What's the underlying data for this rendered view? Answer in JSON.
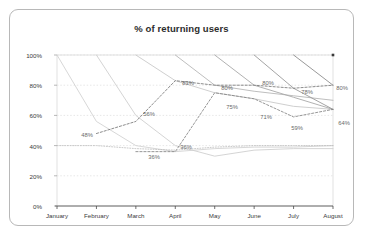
{
  "card": {
    "border_color": "#b8b8b8"
  },
  "chart_data": {
    "type": "line",
    "title": "% of returning users",
    "xlabel": "",
    "ylabel": "",
    "categories": [
      "January",
      "February",
      "March",
      "April",
      "May",
      "June",
      "July",
      "August"
    ],
    "ylim": [
      0,
      100
    ],
    "yticks": [
      "0%",
      "20%",
      "40%",
      "60%",
      "80%",
      "100%"
    ],
    "ytick_values": [
      0,
      20,
      40,
      60,
      80,
      100
    ],
    "grid": true,
    "grid_color": "#dcdcdc",
    "legend": "none",
    "series": [
      {
        "name": "Cohort January",
        "style": "solid",
        "color": "#d2d2d2",
        "x": [
          "January",
          "February",
          "March",
          "April",
          "May",
          "June",
          "July",
          "August"
        ],
        "values": [
          100,
          56,
          40,
          36,
          38,
          39,
          39,
          40
        ]
      },
      {
        "name": "Cohort February",
        "style": "solid",
        "color": "#cfcfcf",
        "x": [
          "February",
          "March",
          "April",
          "May",
          "June",
          "July",
          "August"
        ],
        "values": [
          100,
          60,
          40,
          33,
          37,
          38,
          38
        ]
      },
      {
        "name": "Cohort March",
        "style": "solid",
        "color": "#c9c9c9",
        "x": [
          "March",
          "April",
          "May",
          "June",
          "July",
          "August"
        ],
        "values": [
          100,
          83,
          75,
          71,
          66,
          64
        ]
      },
      {
        "name": "Cohort April",
        "style": "solid",
        "color": "#b7b7b7",
        "x": [
          "April",
          "May",
          "June",
          "July",
          "August"
        ],
        "values": [
          100,
          80,
          76,
          73,
          70
        ]
      },
      {
        "name": "Cohort May",
        "style": "solid",
        "color": "#a8a8a8",
        "x": [
          "May",
          "June",
          "July",
          "August"
        ],
        "values": [
          100,
          80,
          72,
          64
        ]
      },
      {
        "name": "Cohort June",
        "style": "solid",
        "color": "#9a9a9a",
        "x": [
          "June",
          "July",
          "August"
        ],
        "values": [
          100,
          78,
          64
        ]
      },
      {
        "name": "Cohort July",
        "style": "solid",
        "color": "#8d8d8d",
        "x": [
          "July",
          "August"
        ],
        "values": [
          100,
          80
        ]
      },
      {
        "name": "Average high",
        "style": "dashed",
        "color": "#6f6f6f",
        "x": [
          "February",
          "March",
          "April",
          "May",
          "June",
          "July",
          "August"
        ],
        "values": [
          48,
          56,
          83,
          80,
          80,
          78,
          80
        ],
        "labels": [
          "48%",
          "56%",
          "83%",
          "80%",
          "80%",
          "78%",
          "80%"
        ]
      },
      {
        "name": "Average low",
        "style": "dashed",
        "color": "#7c7c7c",
        "x": [
          "March",
          "April",
          "May",
          "June",
          "July",
          "August"
        ],
        "values": [
          36,
          36,
          75,
          71,
          59,
          64
        ],
        "labels": [
          "36%",
          "36%",
          "75%",
          "71%",
          "59%",
          "64%"
        ]
      },
      {
        "name": "Baseline flat",
        "style": "dotted",
        "color": "#bdbdbd",
        "x": [
          "January",
          "February",
          "March",
          "April",
          "May",
          "June",
          "July",
          "August"
        ],
        "values": [
          40,
          40,
          38,
          37,
          39,
          40,
          40,
          40
        ]
      }
    ],
    "point_markers": [
      {
        "name": "august-top-marker",
        "x": "August",
        "value": 100,
        "color": "#3a3a3a"
      }
    ],
    "data_labels": [
      {
        "text": "48%",
        "x": 77,
        "y": 125
      },
      {
        "text": "56%",
        "x": 139,
        "y": 104
      },
      {
        "text": "36%",
        "x": 144,
        "y": 147
      },
      {
        "text": "36%",
        "x": 176,
        "y": 137
      },
      {
        "text": "83%",
        "x": 178,
        "y": 73
      },
      {
        "text": "80%",
        "x": 217,
        "y": 78
      },
      {
        "text": "75%",
        "x": 222,
        "y": 97
      },
      {
        "text": "80%",
        "x": 258,
        "y": 73
      },
      {
        "text": "71%",
        "x": 256,
        "y": 107
      },
      {
        "text": "78%",
        "x": 297,
        "y": 82
      },
      {
        "text": "59%",
        "x": 287,
        "y": 118
      },
      {
        "text": "80%",
        "x": 332,
        "y": 78
      },
      {
        "text": "64%",
        "x": 334,
        "y": 113
      }
    ]
  }
}
